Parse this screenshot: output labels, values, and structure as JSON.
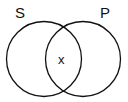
{
  "diagram": {
    "type": "venn",
    "sets": [
      {
        "label": "S",
        "cx": 44,
        "cy": 59,
        "r": 38
      },
      {
        "label": "P",
        "cx": 83,
        "cy": 59,
        "r": 38
      }
    ],
    "intersection_mark": "x",
    "stroke_color": "#111111"
  }
}
